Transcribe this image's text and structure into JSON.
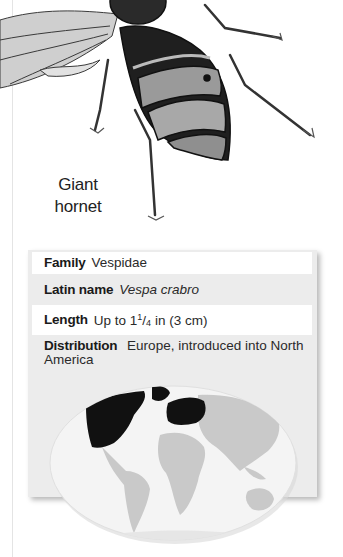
{
  "species": {
    "label_line1": "Giant",
    "label_line2": "hornet"
  },
  "facts": {
    "family": {
      "key": "Family",
      "value": "Vespidae"
    },
    "latin_name": {
      "key": "Latin name",
      "value": "Vespa crabro"
    },
    "length": {
      "key": "Length",
      "value_prefix": "Up to 1",
      "frac_num": "1",
      "frac_den": "4",
      "value_suffix": " in (3 cm)"
    },
    "distribution": {
      "key": "Distribution",
      "value": "Europe, introduced into North America"
    }
  },
  "map": {
    "highlighted_regions": [
      "North America",
      "Europe"
    ],
    "highlight_color": "#111111",
    "land_color": "#c9c9c9",
    "ocean_color": "#f4f4f4"
  },
  "colors": {
    "box_grey": "#ececec",
    "row_white": "#ffffff"
  }
}
